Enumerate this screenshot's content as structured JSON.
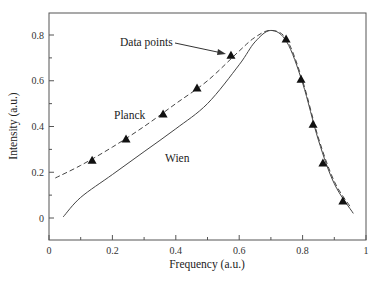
{
  "chart_data": {
    "type": "line",
    "title": "",
    "xlabel": "Frequency (a.u.)",
    "ylabel": "Intensity (a.u.)",
    "xlim": [
      0,
      1
    ],
    "ylim": [
      -0.095,
      0.9
    ],
    "xticks": [
      "0",
      "0.2",
      "0.4",
      "0.6",
      "0.8",
      "1"
    ],
    "yticks": [
      "0",
      "0.2",
      "0.4",
      "0.6",
      "0.8"
    ],
    "grid": false,
    "legend": "none (inline annotations)",
    "series": [
      {
        "name": "Planck",
        "style": "dashed",
        "x": [
          0.02,
          0.1,
          0.2,
          0.3,
          0.4,
          0.5,
          0.6,
          0.65,
          0.7,
          0.75,
          0.8,
          0.85,
          0.9,
          0.95
        ],
        "y": [
          0.175,
          0.23,
          0.31,
          0.4,
          0.5,
          0.6,
          0.73,
          0.79,
          0.82,
          0.78,
          0.6,
          0.35,
          0.16,
          0.05
        ]
      },
      {
        "name": "Wien",
        "style": "solid",
        "x": [
          0.045,
          0.1,
          0.2,
          0.3,
          0.4,
          0.5,
          0.6,
          0.65,
          0.7,
          0.75,
          0.8,
          0.85,
          0.9,
          0.96
        ],
        "y": [
          0.005,
          0.09,
          0.19,
          0.29,
          0.39,
          0.5,
          0.67,
          0.77,
          0.82,
          0.77,
          0.59,
          0.34,
          0.15,
          0.02
        ]
      },
      {
        "name": "Data points",
        "style": "triangle-markers",
        "x": [
          0.136,
          0.243,
          0.36,
          0.467,
          0.574,
          0.748,
          0.795,
          0.833,
          0.864,
          0.927
        ],
        "y": [
          0.253,
          0.345,
          0.455,
          0.568,
          0.712,
          0.782,
          0.607,
          0.41,
          0.24,
          0.074
        ]
      }
    ],
    "annotations": [
      {
        "text": "Data points",
        "arrow_to": [
          0.574,
          0.712
        ]
      },
      {
        "text": "Planck",
        "near": [
          0.21,
          0.47
        ]
      },
      {
        "text": "Wien",
        "near": [
          0.36,
          0.26
        ]
      }
    ]
  }
}
